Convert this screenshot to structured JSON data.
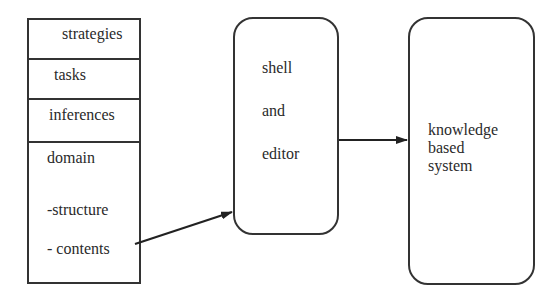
{
  "stack": {
    "rows": [
      "strategies",
      "tasks",
      "inferences"
    ],
    "domain": {
      "title": "domain",
      "items": [
        "-structure",
        "- contents"
      ]
    }
  },
  "shell_box": {
    "lines": [
      "shell",
      "and",
      "editor"
    ]
  },
  "kb_box": {
    "lines": [
      "knowledge",
      "based",
      "system"
    ]
  },
  "arrows": [
    {
      "from": "domain-contents",
      "to": "shell-and-editor"
    },
    {
      "from": "shell-and-editor",
      "to": "knowledge-based-system"
    }
  ]
}
